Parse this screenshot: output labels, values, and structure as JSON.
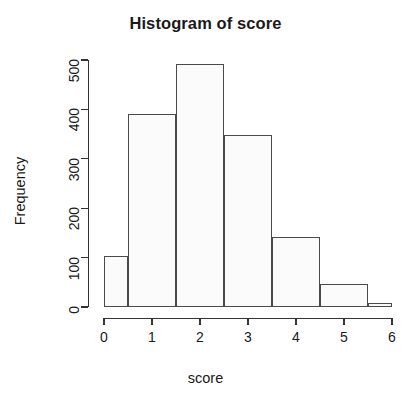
{
  "chart_data": {
    "type": "bar",
    "title": "Histogram of score",
    "xlabel": "score",
    "ylabel": "Frequency",
    "grid": false,
    "legend": null,
    "xlim": [
      0,
      6
    ],
    "ylim": [
      0,
      530
    ],
    "x_ticks": [
      "0",
      "1",
      "2",
      "3",
      "4",
      "5",
      "6"
    ],
    "x_tick_values": [
      0,
      1,
      2,
      3,
      4,
      5,
      6
    ],
    "y_ticks": [
      "0",
      "100",
      "200",
      "300",
      "400",
      "500"
    ],
    "y_tick_values": [
      0,
      100,
      200,
      300,
      400,
      500
    ],
    "bin_edges": [
      0,
      0.5,
      1.5,
      2.5,
      3.5,
      4.5,
      5.5,
      6
    ],
    "categories": [
      "0-0.5",
      "0.5-1.5",
      "1.5-2.5",
      "2.5-3.5",
      "3.5-4.5",
      "4.5-5.5",
      "5.5-6"
    ],
    "values": [
      103,
      390,
      492,
      348,
      141,
      47,
      9
    ],
    "bars": [
      {
        "label": "0-0.5",
        "x0": 0,
        "x1": 0.5,
        "value": 103
      },
      {
        "label": "0.5-1.5",
        "x0": 0.5,
        "x1": 1.5,
        "value": 390
      },
      {
        "label": "1.5-2.5",
        "x0": 1.5,
        "x1": 2.5,
        "value": 492
      },
      {
        "label": "2.5-3.5",
        "x0": 2.5,
        "x1": 3.5,
        "value": 348
      },
      {
        "label": "3.5-4.5",
        "x0": 3.5,
        "x1": 4.5,
        "value": 141
      },
      {
        "label": "4.5-5.5",
        "x0": 4.5,
        "x1": 5.5,
        "value": 47
      },
      {
        "label": "5.5-6",
        "x0": 5.5,
        "x1": 6,
        "value": 9
      }
    ],
    "colors": {
      "bar_fill": "#fbfbfb",
      "bar_border": "#4a4a4a",
      "axis": "#333333",
      "text": "#1a1a1a",
      "background": "#ffffff"
    }
  }
}
